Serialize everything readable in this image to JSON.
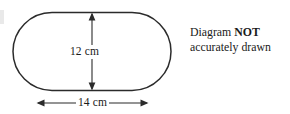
{
  "figure": {
    "shape_name": "stadium",
    "stroke_color": "#2b2b2b",
    "fill_color": "#ffffff",
    "background_color": "#ffffff",
    "height_dimension": {
      "label": "12 cm",
      "value": 12,
      "unit": "cm",
      "orientation": "vertical",
      "arrow": "double-headed"
    },
    "width_dimension": {
      "label": "14 cm",
      "value": 14,
      "unit": "cm",
      "orientation": "horizontal",
      "arrow": "double-headed"
    }
  },
  "note": {
    "line1_prefix": "Diagram ",
    "line1_bold": "NOT",
    "line2": "accurately drawn"
  }
}
